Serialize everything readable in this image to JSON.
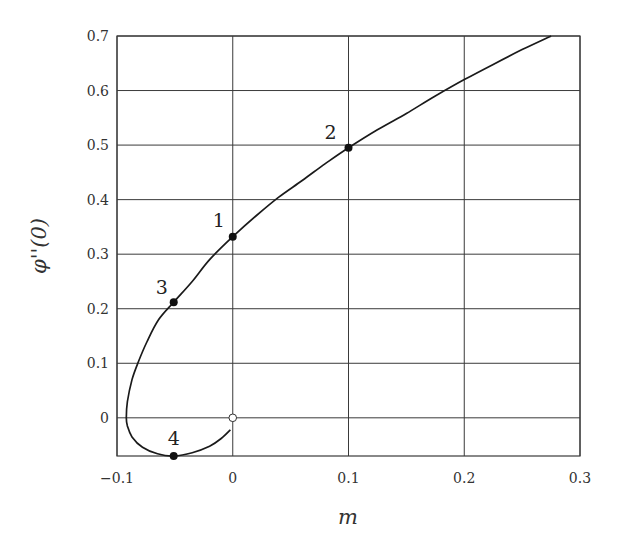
{
  "chart_data": {
    "type": "line",
    "title": "",
    "xlabel": "m",
    "ylabel": "φ''(0)",
    "xlim": [
      -0.1,
      0.3
    ],
    "ylim": [
      -0.07,
      0.7
    ],
    "grid": true,
    "legend": null,
    "x_ticks": [
      "−0.1",
      "0",
      "0.1",
      "0.2",
      "0.3"
    ],
    "y_ticks": [
      "0",
      "0.1",
      "0.2",
      "0.3",
      "0.4",
      "0.5",
      "0.6",
      "0.7"
    ],
    "series": [
      {
        "name": "solution branch",
        "points": [
          [
            -0.002,
            -0.022
          ],
          [
            -0.01,
            -0.038
          ],
          [
            -0.02,
            -0.052
          ],
          [
            -0.035,
            -0.064
          ],
          [
            -0.051,
            -0.07
          ],
          [
            -0.065,
            -0.066
          ],
          [
            -0.078,
            -0.054
          ],
          [
            -0.087,
            -0.035
          ],
          [
            -0.091,
            -0.015
          ],
          [
            -0.092,
            0.0
          ],
          [
            -0.091,
            0.03
          ],
          [
            -0.087,
            0.07
          ],
          [
            -0.082,
            0.1
          ],
          [
            -0.074,
            0.14
          ],
          [
            -0.064,
            0.18
          ],
          [
            -0.051,
            0.212
          ],
          [
            -0.035,
            0.25
          ],
          [
            -0.02,
            0.29
          ],
          [
            0.0,
            0.332
          ],
          [
            0.02,
            0.37
          ],
          [
            0.04,
            0.405
          ],
          [
            0.06,
            0.435
          ],
          [
            0.08,
            0.466
          ],
          [
            0.1,
            0.495
          ],
          [
            0.125,
            0.528
          ],
          [
            0.15,
            0.558
          ],
          [
            0.175,
            0.59
          ],
          [
            0.2,
            0.62
          ],
          [
            0.225,
            0.648
          ],
          [
            0.25,
            0.675
          ],
          [
            0.275,
            0.7
          ]
        ]
      }
    ],
    "annotations": [
      {
        "label": "1",
        "x": 0.0,
        "y": 0.332,
        "marker": "filled"
      },
      {
        "label": "2",
        "x": 0.1,
        "y": 0.495,
        "marker": "filled"
      },
      {
        "label": "3",
        "x": -0.051,
        "y": 0.212,
        "marker": "filled"
      },
      {
        "label": "4",
        "x": -0.051,
        "y": -0.07,
        "marker": "filled"
      },
      {
        "label": "",
        "x": 0.0,
        "y": 0.0,
        "marker": "open"
      }
    ]
  },
  "layout": {
    "plot_px": {
      "left": 117,
      "top": 36,
      "right": 580,
      "bottom": 456
    },
    "line_color": "#1a1a1a",
    "grid_color": "#3a3a3a"
  }
}
